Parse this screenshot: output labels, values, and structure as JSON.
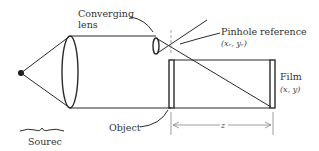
{
  "diagram": {
    "labels": {
      "converging_lens_line1": "Converging",
      "converging_lens_line2": "lens",
      "pinhole_reference": "Pinhole reference",
      "pinhole_coords": "(xᵣ, yᵣ)",
      "film": "Film",
      "film_coords": "(x, y)",
      "object": "Object",
      "source": "Sourec",
      "distance": "z"
    }
  }
}
